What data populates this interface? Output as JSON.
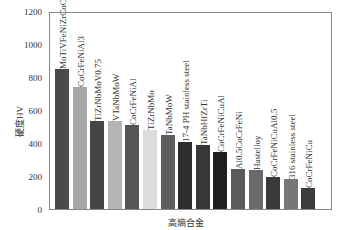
{
  "chart_data": {
    "type": "bar",
    "title": "",
    "xlabel": "高熵合金",
    "ylabel": "硬度HV",
    "ylim": [
      0,
      1200
    ],
    "yticks": [
      0,
      200,
      400,
      600,
      800,
      1000,
      1200
    ],
    "grid": false,
    "categories": [
      "MoTiVFeNiZrCoCr",
      "CoCrFeNiAl3",
      "TiZrNbMoV0.75",
      "VTaNbMoW",
      "CoCrFeNiAl",
      "TiZrNbMo",
      "TaNbMoW",
      "17-4 PH stainless steel",
      "TaNbHfZrTi",
      "CoCrFeNiCuAl",
      "Al0.5CoCrFeNi",
      "Hastelloy",
      "CoCrFeNiCuAl0.5",
      "316 stainless steel",
      "CoCrFeNiCu"
    ],
    "values": [
      848,
      740,
      533,
      533,
      510,
      480,
      450,
      405,
      388,
      345,
      242,
      236,
      195,
      182,
      127
    ],
    "colors": [
      "#4a4a4a",
      "#a6a6a6",
      "#454545",
      "#b5b5b5",
      "#555555",
      "#dcdcdc",
      "#5e5e5e",
      "#2e2e2e",
      "#383838",
      "#1f1f1f",
      "#5a5a5a",
      "#6a6a6a",
      "#3a3a3a",
      "#777777",
      "#3c3c3c"
    ]
  }
}
